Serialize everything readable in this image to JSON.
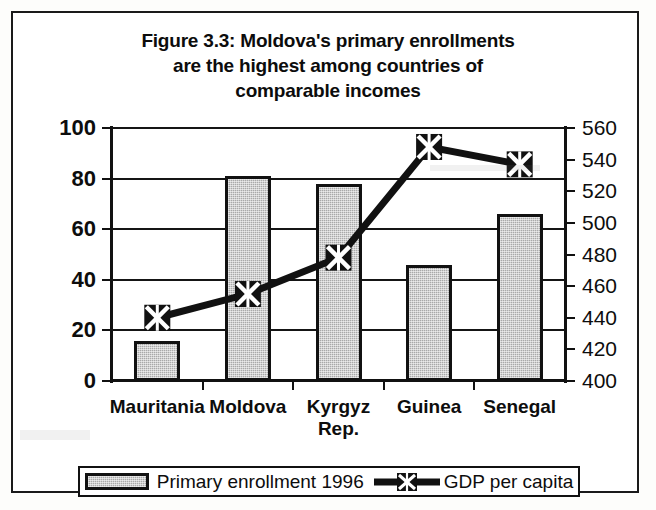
{
  "figure": {
    "title_lines": [
      "Figure 3.3:  Moldova's primary enrollments",
      "are the highest among countries of",
      "comparable incomes"
    ]
  },
  "legend": {
    "items": [
      {
        "label": "Primary enrollment 1996",
        "marker": "bar-swatch",
        "color": "#a9a9a9"
      },
      {
        "label": "GDP per capita",
        "marker": "line-x-marker",
        "color": "#111111"
      }
    ]
  },
  "chart_data": {
    "type": "bar",
    "title": "Figure 3.3:  Moldova's primary enrollments are the highest among countries of comparable incomes",
    "xlabel": "",
    "ylabel": "",
    "categories": [
      "Mauritania",
      "Moldova",
      "Kyrgyz Rep.",
      "Guinea",
      "Senegal"
    ],
    "category_lines": [
      [
        "Mauritania"
      ],
      [
        "Moldova"
      ],
      [
        "Kyrgyz",
        "Rep."
      ],
      [
        "Guinea"
      ],
      [
        "Senegal"
      ]
    ],
    "grid": true,
    "legend_position": "bottom",
    "series": [
      {
        "name": "Primary enrollment 1996",
        "type": "bar",
        "axis": "left",
        "color": "#a9a9a9",
        "values": [
          16,
          81,
          78,
          46,
          66
        ]
      },
      {
        "name": "GDP per capita",
        "type": "line",
        "axis": "right",
        "color": "#111111",
        "marker": "x",
        "values": [
          440,
          455,
          478,
          548,
          537
        ]
      }
    ],
    "axes": {
      "left": {
        "ylim": [
          0,
          100
        ],
        "ticks": [
          0,
          20,
          40,
          60,
          80,
          100
        ],
        "tick_labels": [
          "0",
          "20",
          "40",
          "60",
          "80",
          "100"
        ]
      },
      "right": {
        "ylim": [
          400,
          560
        ],
        "ticks": [
          400,
          420,
          440,
          460,
          480,
          500,
          520,
          540,
          560
        ],
        "tick_labels": [
          "400",
          "420",
          "440",
          "460",
          "480",
          "500",
          "520",
          "540",
          "560"
        ]
      }
    }
  }
}
